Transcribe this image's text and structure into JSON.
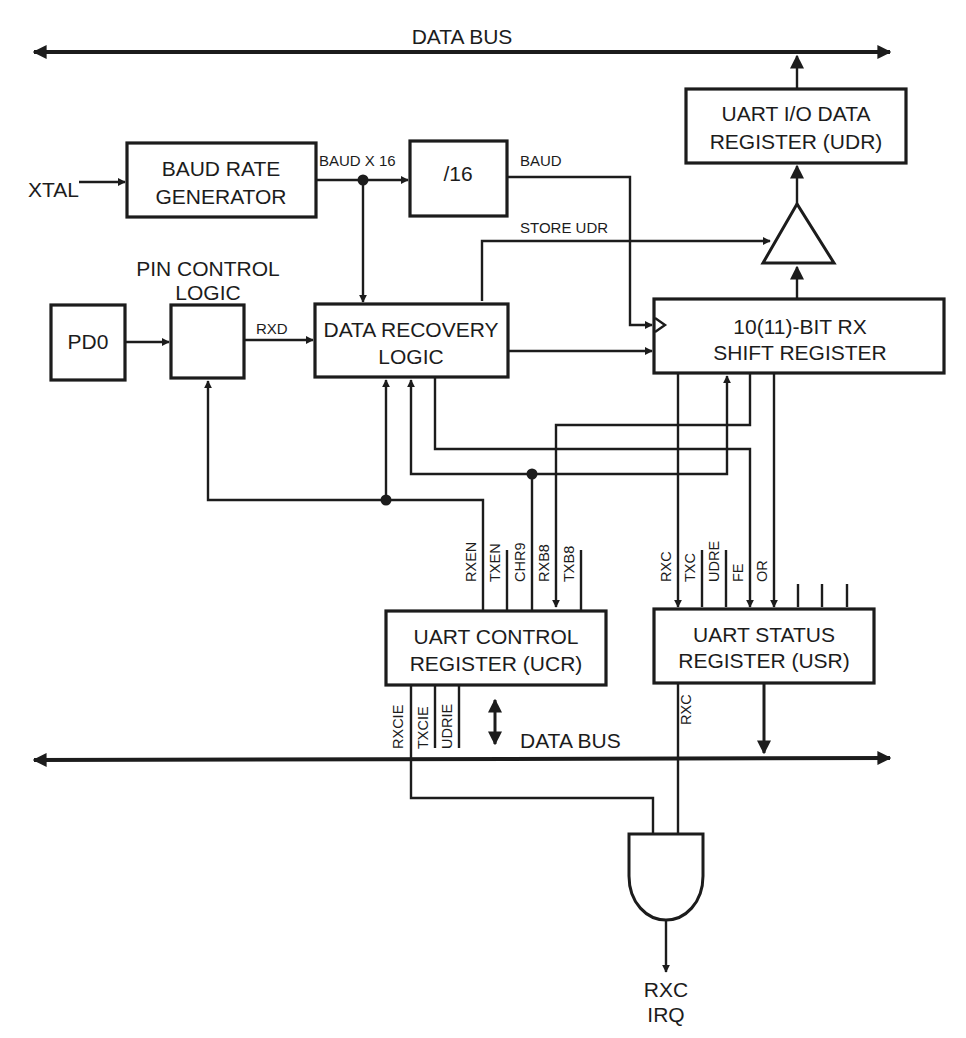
{
  "colors": {
    "ink": "#1c1c1c",
    "background": "#ffffff"
  },
  "buses": {
    "top_label": "DATA BUS",
    "bottom_label": "DATA BUS"
  },
  "blocks": {
    "baud_rate_generator": {
      "line1": "BAUD RATE",
      "line2": "GENERATOR"
    },
    "divider": {
      "label": "/16"
    },
    "udr": {
      "line1": "UART I/O DATA",
      "line2": "REGISTER (UDR)"
    },
    "pd0": {
      "label": "PD0"
    },
    "pin_control": {
      "line1": "PIN CONTROL",
      "line2": "LOGIC"
    },
    "data_recovery": {
      "line1": "DATA RECOVERY",
      "line2": "LOGIC"
    },
    "shift_register": {
      "line1": "10(11)-BIT RX",
      "line2": "SHIFT REGISTER"
    },
    "ucr": {
      "line1": "UART CONTROL",
      "line2": "REGISTER (UCR)"
    },
    "usr": {
      "line1": "UART STATUS",
      "line2": "REGISTER (USR)"
    }
  },
  "signals": {
    "xtal": "XTAL",
    "baud_x16": "BAUD X 16",
    "baud": "BAUD",
    "store_udr": "STORE UDR",
    "rxd": "RXD",
    "rxc_usr_out": "RXC",
    "irq_line1": "RXC",
    "irq_line2": "IRQ"
  },
  "ucr_top_bits": [
    "RXEN",
    "TXEN",
    "CHR9",
    "RXB8",
    "TXB8"
  ],
  "ucr_bottom_bits": [
    "RXCIE",
    "TXCIE",
    "UDRIE"
  ],
  "usr_top_bits": [
    "RXC",
    "TXC",
    "UDRE",
    "FE",
    "OR"
  ],
  "gates": {
    "tristate_buffer": "buffer-triangle",
    "irq_gate": "and-gate"
  }
}
